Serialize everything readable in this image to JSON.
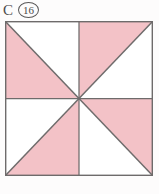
{
  "label": {
    "letter": "C",
    "number": "16",
    "circled": true
  },
  "background_color": "#fdfcfc",
  "figure": {
    "name": "pinwheel-shaded-square",
    "outer_square": {
      "x": 5,
      "y": 21,
      "width": 148,
      "height": 155,
      "stroke_color": "#6e6b6b",
      "stroke_width": 1.4
    },
    "grid": {
      "rows": 2,
      "cols": 2,
      "midline_color": "#6e6b6b",
      "midline_width": 1.2
    },
    "colors": {
      "shaded": "#f3c2c7",
      "unshaded": "#ffffff",
      "line": "#6e6b6b",
      "diagonal": "#6f6c6c"
    },
    "total_triangles": 8,
    "shaded_triangles": 4,
    "fraction_shaded": "1/2",
    "quadrants": [
      {
        "name": "top-left",
        "diagonal": "tl-br",
        "shaded_part": "lower-left"
      },
      {
        "name": "top-right",
        "diagonal": "bl-tr",
        "shaded_part": "upper-left"
      },
      {
        "name": "bottom-left",
        "diagonal": "bl-tr",
        "shaded_part": "lower-right"
      },
      {
        "name": "bottom-right",
        "diagonal": "tl-br",
        "shaded_part": "upper-right"
      }
    ]
  }
}
